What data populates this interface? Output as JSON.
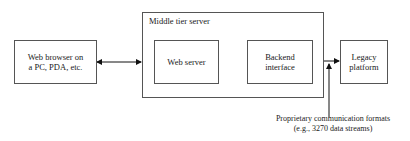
{
  "diagram": {
    "nodes": {
      "browser": {
        "line1": "Web browser on",
        "line2": "a  PC, PDA, etc."
      },
      "middle_tier": {
        "title": "Middle tier server"
      },
      "web_server": {
        "label": "Web server"
      },
      "backend": {
        "line1": "Backend",
        "line2": "interface"
      },
      "legacy": {
        "line1": "Legacy",
        "line2": "platform"
      }
    },
    "edges": [
      {
        "from": "browser",
        "to": "middle_tier",
        "type": "bidirectional"
      },
      {
        "from": "web_server",
        "to": "backend",
        "type": "bidirectional"
      },
      {
        "from": "backend",
        "to": "legacy",
        "type": "bidirectional"
      }
    ],
    "annotation": {
      "line1": "Proprietary communication formats",
      "line2": "(e.g., 3270 data streams)"
    }
  }
}
